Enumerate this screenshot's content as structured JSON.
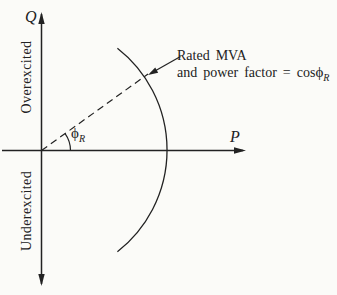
{
  "page": {
    "background": "#fbfbf8",
    "ink": "#222222"
  },
  "diagram": {
    "type": "generator-capability-pq-plane",
    "q_axis_label": "Q",
    "p_axis_label": "P",
    "upper_region_label": "Overexcited",
    "lower_region_label": "Underexcited",
    "annotation": {
      "line1": "Rated MVA",
      "line2": "and power factor = cos",
      "phi_symbol": "ϕ",
      "phi_subscript": "R"
    },
    "angle_label": {
      "phi_symbol": "ϕ",
      "subscript": "R"
    }
  }
}
